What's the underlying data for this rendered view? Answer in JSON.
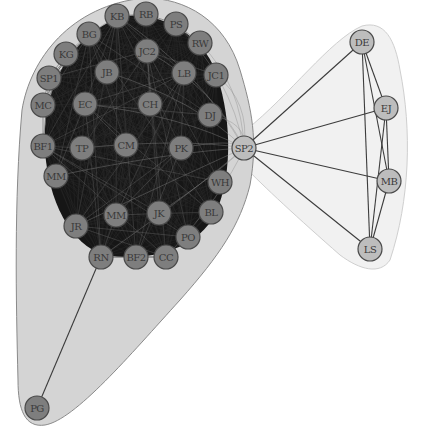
{
  "diagram": {
    "type": "network-graph",
    "colors": {
      "background": "#ffffff",
      "cluster_left_fill": "#d4d4d4",
      "cluster_left_stroke": "#8a8a8a",
      "cluster_right_fill": "#f1f1f1",
      "cluster_right_stroke": "#cfcfcf",
      "dense_core": "#161616",
      "node_fill_core": "#7e7e7e",
      "node_fill_light": "#bdbdbd",
      "node_stroke": "#4a4a4a",
      "edge": "#3c3c3c",
      "label": "#333333"
    },
    "node_radius": 12,
    "clusters": [
      {
        "id": "left-cluster",
        "members": [
          "KB",
          "RB",
          "PS",
          "BG",
          "RW",
          "KG",
          "JC2",
          "SP1",
          "JB",
          "LB",
          "JC1",
          "MC",
          "EC",
          "CH",
          "DJ",
          "BF1",
          "TP",
          "CM",
          "PK",
          "WH",
          "MM1",
          "MM2",
          "JK",
          "BL",
          "JR",
          "PO",
          "RN",
          "BF2",
          "CC",
          "PG"
        ]
      },
      {
        "id": "right-cluster",
        "members": [
          "SP2",
          "DE",
          "EJ",
          "MB",
          "LS"
        ]
      }
    ],
    "nodes": [
      {
        "id": "KB",
        "label": "KB",
        "x": 117,
        "y": 16,
        "style": "core"
      },
      {
        "id": "RB",
        "label": "RB",
        "x": 146,
        "y": 14,
        "style": "core"
      },
      {
        "id": "PS",
        "label": "PS",
        "x": 176,
        "y": 24,
        "style": "core"
      },
      {
        "id": "BG",
        "label": "BG",
        "x": 89,
        "y": 34,
        "style": "core"
      },
      {
        "id": "RW",
        "label": "RW",
        "x": 200,
        "y": 43,
        "style": "core"
      },
      {
        "id": "KG",
        "label": "KG",
        "x": 66,
        "y": 54,
        "style": "core"
      },
      {
        "id": "JC2",
        "label": "JC2",
        "x": 147,
        "y": 51,
        "style": "core"
      },
      {
        "id": "SP1",
        "label": "SP1",
        "x": 49,
        "y": 78,
        "style": "core"
      },
      {
        "id": "JB",
        "label": "JB",
        "x": 107,
        "y": 72,
        "style": "core"
      },
      {
        "id": "LB",
        "label": "LB",
        "x": 184,
        "y": 73,
        "style": "core"
      },
      {
        "id": "JC1",
        "label": "JC1",
        "x": 216,
        "y": 75,
        "style": "core"
      },
      {
        "id": "MC",
        "label": "MC",
        "x": 43,
        "y": 105,
        "style": "core"
      },
      {
        "id": "EC",
        "label": "EC",
        "x": 85,
        "y": 104,
        "style": "core"
      },
      {
        "id": "CH",
        "label": "CH",
        "x": 150,
        "y": 104,
        "style": "core"
      },
      {
        "id": "DJ",
        "label": "DJ",
        "x": 210,
        "y": 115,
        "style": "core"
      },
      {
        "id": "BF1",
        "label": "BF1",
        "x": 43,
        "y": 146,
        "style": "core"
      },
      {
        "id": "TP",
        "label": "TP",
        "x": 82,
        "y": 148,
        "style": "core"
      },
      {
        "id": "CM",
        "label": "CM",
        "x": 126,
        "y": 145,
        "style": "core"
      },
      {
        "id": "PK",
        "label": "PK",
        "x": 181,
        "y": 148,
        "style": "core"
      },
      {
        "id": "WH",
        "label": "WH",
        "x": 220,
        "y": 182,
        "style": "core"
      },
      {
        "id": "MM1",
        "label": "MM",
        "x": 56,
        "y": 176,
        "style": "core"
      },
      {
        "id": "MM2",
        "label": "MM",
        "x": 116,
        "y": 215,
        "style": "core"
      },
      {
        "id": "JK",
        "label": "JK",
        "x": 159,
        "y": 213,
        "style": "core"
      },
      {
        "id": "BL",
        "label": "BL",
        "x": 211,
        "y": 212,
        "style": "core"
      },
      {
        "id": "JR",
        "label": "JR",
        "x": 76,
        "y": 226,
        "style": "core"
      },
      {
        "id": "PO",
        "label": "PO",
        "x": 188,
        "y": 237,
        "style": "core"
      },
      {
        "id": "RN",
        "label": "RN",
        "x": 101,
        "y": 257,
        "style": "core"
      },
      {
        "id": "BF2",
        "label": "BF2",
        "x": 136,
        "y": 257,
        "style": "core"
      },
      {
        "id": "CC",
        "label": "CC",
        "x": 166,
        "y": 257,
        "style": "core"
      },
      {
        "id": "PG",
        "label": "PG",
        "x": 37,
        "y": 408,
        "style": "core"
      },
      {
        "id": "SP2",
        "label": "SP2",
        "x": 244,
        "y": 148,
        "style": "light"
      },
      {
        "id": "DE",
        "label": "DE",
        "x": 362,
        "y": 42,
        "style": "light"
      },
      {
        "id": "EJ",
        "label": "EJ",
        "x": 386,
        "y": 108,
        "style": "light"
      },
      {
        "id": "MB",
        "label": "MB",
        "x": 389,
        "y": 181,
        "style": "light"
      },
      {
        "id": "LS",
        "label": "LS",
        "x": 370,
        "y": 249,
        "style": "light"
      }
    ],
    "edges": [
      [
        "RN",
        "PG"
      ],
      [
        "SP2",
        "DE"
      ],
      [
        "SP2",
        "EJ"
      ],
      [
        "SP2",
        "MB"
      ],
      [
        "SP2",
        "LS"
      ],
      [
        "DE",
        "EJ"
      ],
      [
        "DE",
        "MB"
      ],
      [
        "DE",
        "LS"
      ],
      [
        "EJ",
        "MB"
      ],
      [
        "EJ",
        "LS"
      ],
      [
        "MB",
        "LS"
      ]
    ],
    "dense_core_note": "left cluster nodes are densely interconnected (near-complete subgraph) rendered as a dark mass"
  },
  "caption": {
    "text": ""
  }
}
